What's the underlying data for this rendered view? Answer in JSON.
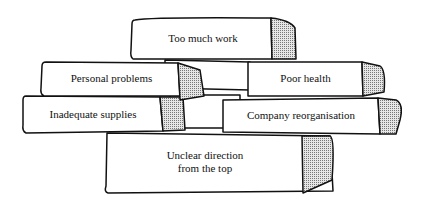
{
  "diagram": {
    "type": "block-wall",
    "blocks": [
      {
        "id": "top",
        "label": "Too much work"
      },
      {
        "id": "personal",
        "label": "Personal problems"
      },
      {
        "id": "health",
        "label": "Poor health"
      },
      {
        "id": "supplies",
        "label": "Inadequate supplies"
      },
      {
        "id": "reorg",
        "label": "Company reorganisation"
      },
      {
        "id": "direction",
        "label_line1": "Unclear direction",
        "label_line2": "from the top"
      }
    ],
    "colors": {
      "stroke": "#111111",
      "fill": "#ffffff",
      "shade": "#bdbdbd"
    }
  }
}
